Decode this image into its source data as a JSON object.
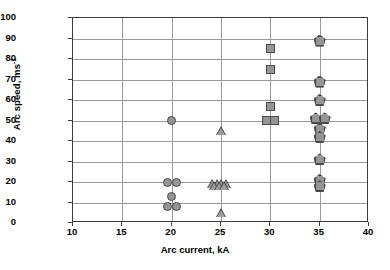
{
  "chart_data": {
    "type": "scatter",
    "title": "",
    "xlabel": "Arc current, kA",
    "ylabel": "Arc speed, ms",
    "ylabel_exponent": "-1",
    "xlim": [
      10,
      40
    ],
    "ylim": [
      0,
      100
    ],
    "xticks": [
      10,
      15,
      20,
      25,
      30,
      35,
      40
    ],
    "yticks": [
      0,
      10,
      20,
      30,
      40,
      50,
      60,
      70,
      80,
      90,
      100
    ],
    "grid": "both",
    "legend": "none",
    "series": [
      {
        "name": "circle-series",
        "marker": "circle",
        "color": "#969696",
        "points": [
          {
            "x": 20,
            "y": 50
          },
          {
            "x": 19.6,
            "y": 20
          },
          {
            "x": 20.5,
            "y": 20
          },
          {
            "x": 20,
            "y": 13
          },
          {
            "x": 19.6,
            "y": 8
          },
          {
            "x": 20.5,
            "y": 8
          }
        ]
      },
      {
        "name": "triangle-series",
        "marker": "triangle",
        "color": "#9e9e9e",
        "points": [
          {
            "x": 25,
            "y": 45
          },
          {
            "x": 24.1,
            "y": 19
          },
          {
            "x": 24.6,
            "y": 19
          },
          {
            "x": 25.1,
            "y": 19
          },
          {
            "x": 25.6,
            "y": 19
          },
          {
            "x": 24.35,
            "y": 18
          },
          {
            "x": 24.85,
            "y": 18
          },
          {
            "x": 25.35,
            "y": 18
          },
          {
            "x": 25,
            "y": 5
          }
        ]
      },
      {
        "name": "square-series",
        "marker": "square",
        "color": "#969696",
        "points": [
          {
            "x": 30,
            "y": 85
          },
          {
            "x": 30,
            "y": 75
          },
          {
            "x": 30,
            "y": 57
          },
          {
            "x": 29.6,
            "y": 50
          },
          {
            "x": 30.4,
            "y": 50
          }
        ]
      },
      {
        "name": "pentagon-series",
        "marker": "pentagon",
        "color": "#969696",
        "points": [
          {
            "x": 35,
            "y": 89
          },
          {
            "x": 35,
            "y": 69
          },
          {
            "x": 35,
            "y": 60
          },
          {
            "x": 34.6,
            "y": 51
          },
          {
            "x": 35.5,
            "y": 51
          },
          {
            "x": 35,
            "y": 46
          },
          {
            "x": 35,
            "y": 42
          },
          {
            "x": 35,
            "y": 31
          },
          {
            "x": 35,
            "y": 21
          },
          {
            "x": 35,
            "y": 18
          }
        ]
      }
    ]
  }
}
